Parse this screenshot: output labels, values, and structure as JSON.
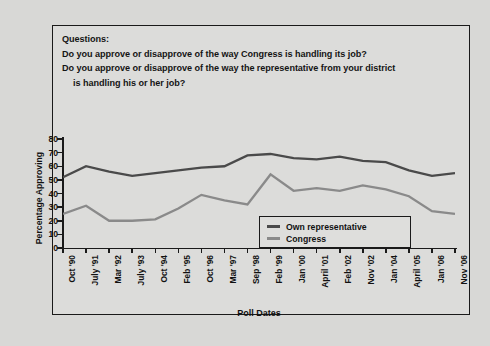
{
  "questions": {
    "heading": "Questions:",
    "q1": "Do you approve or disapprove of the way Congress is handling its job?",
    "q2": "Do you approve or disapprove of the way the representative from your district",
    "q2_cont": "is handling his or her job?"
  },
  "legend": {
    "items": [
      {
        "label": "Own representative",
        "color": "#4a4a4a"
      },
      {
        "label": "Congress",
        "color": "#8a8a8a"
      }
    ]
  },
  "chart_data": {
    "type": "line",
    "title": "",
    "xlabel": "Poll Dates",
    "ylabel": "Percentage Approving",
    "ylim": [
      0,
      80
    ],
    "yticks": [
      80,
      70,
      60,
      50,
      40,
      30,
      20,
      10,
      0
    ],
    "grid": false,
    "legend_position": "inside-bottom-right",
    "categories": [
      "Oct '90",
      "July '91",
      "Mar '92",
      "July '93",
      "Oct '94",
      "Feb '95",
      "Oct '96",
      "Mar '97",
      "Sep '98",
      "Feb '99",
      "Jan '00",
      "April '01",
      "Feb '02",
      "Nov '02",
      "Jan '04",
      "April '05",
      "Jan '06",
      "Nov '06"
    ],
    "series": [
      {
        "name": "Own representative",
        "color": "#4a4a4a",
        "values": [
          52,
          60,
          56,
          53,
          55,
          57,
          59,
          60,
          68,
          69,
          66,
          65,
          67,
          64,
          63,
          57,
          53,
          55
        ]
      },
      {
        "name": "Congress",
        "color": "#8a8a8a",
        "values": [
          25,
          31,
          20,
          20,
          21,
          29,
          39,
          35,
          32,
          54,
          42,
          44,
          42,
          46,
          43,
          38,
          27,
          25
        ]
      }
    ]
  }
}
